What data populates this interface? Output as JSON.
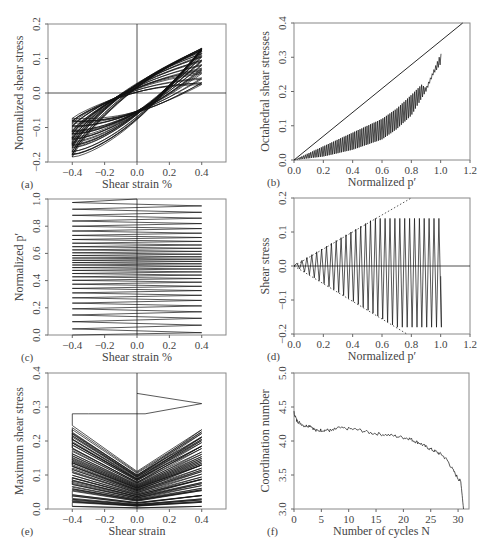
{
  "chart_data": [
    {
      "id": "a",
      "panel_label": "(a)",
      "type": "line",
      "title": "",
      "xlabel": "Shear strain %",
      "ylabel": "Normalized shear stress",
      "xlim": [
        -0.55,
        0.55
      ],
      "ylim": [
        -0.2,
        0.2
      ],
      "xticks": [
        -0.4,
        -0.2,
        0.0,
        0.2,
        0.4
      ],
      "xtick_labels": [
        "−0.4",
        "−0.2",
        "0.0",
        "0.2",
        "0.4"
      ],
      "yticks": [
        -0.2,
        -0.1,
        0.0,
        0.1,
        0.2
      ],
      "ytick_labels": [
        "−0.2",
        "−0.1",
        "0.0",
        "0.1",
        "0.2"
      ],
      "zero_lines": {
        "x": 0.0,
        "y": 0.0
      },
      "description": "Hysteresis loops of strain-controlled cyclic shear between -0.4% and 0.4% strain; stress amplitude ranges roughly -0.18 to 0.14",
      "series": [
        {
          "name": "stress-strain loops",
          "strain_range": [
            -0.4,
            0.4
          ],
          "stress_min": -0.18,
          "stress_max": 0.14,
          "cycles": 31
        }
      ]
    },
    {
      "id": "b",
      "panel_label": "(b)",
      "type": "line",
      "title": "",
      "xlabel": "Normalized p′",
      "ylabel": "Octahedral shear stresses",
      "xlim": [
        0.0,
        1.2
      ],
      "ylim": [
        0.0,
        0.4
      ],
      "xticks": [
        0.0,
        0.2,
        0.4,
        0.6,
        0.8,
        1.0,
        1.2
      ],
      "xtick_labels": [
        "0.0",
        "0.2",
        "0.4",
        "0.6",
        "0.8",
        "1.0",
        "1.2"
      ],
      "yticks": [
        0.0,
        0.1,
        0.2,
        0.3,
        0.4
      ],
      "ytick_labels": [
        "0.0",
        "0.1",
        "0.2",
        "0.3",
        "0.4"
      ],
      "series": [
        {
          "name": "failure line",
          "x": [
            0.0,
            1.15
          ],
          "y": [
            0.0,
            0.4
          ]
        },
        {
          "name": "stress path",
          "x": [
            0.0,
            0.1,
            0.2,
            0.3,
            0.4,
            0.5,
            0.6,
            0.7,
            0.8,
            0.87,
            0.9,
            0.95,
            1.0
          ],
          "y_upper": [
            0.0,
            0.02,
            0.04,
            0.06,
            0.08,
            0.1,
            0.12,
            0.15,
            0.19,
            0.22,
            0.21,
            0.26,
            0.31
          ],
          "y_lower": [
            0.0,
            0.005,
            0.01,
            0.02,
            0.03,
            0.045,
            0.06,
            0.09,
            0.13,
            0.18,
            0.2,
            0.25,
            0.28
          ]
        }
      ]
    },
    {
      "id": "c",
      "panel_label": "(c)",
      "type": "line",
      "title": "",
      "xlabel": "Shear strain %",
      "ylabel": "Normalized p′",
      "xlim": [
        -0.55,
        0.55
      ],
      "ylim": [
        0.0,
        1.0
      ],
      "xticks": [
        -0.4,
        -0.2,
        0.0,
        0.2,
        0.4
      ],
      "xtick_labels": [
        "−0.4",
        "−0.2",
        "0.0",
        "0.2",
        "0.4"
      ],
      "yticks": [
        0.0,
        0.2,
        0.4,
        0.6,
        0.8,
        1.0
      ],
      "ytick_labels": [
        "0.0",
        "0.2",
        "0.4",
        "0.6",
        "0.8",
        "1.0"
      ],
      "zero_lines": {
        "x": 0.0
      },
      "description": "Zig-zag evolution of normalized mean effective stress vs strain; p' decreases from 1.0 toward 0.0 over cycles",
      "series": [
        {
          "name": "p' path",
          "strain_range": [
            -0.4,
            0.4
          ],
          "p_start": 1.0,
          "p_end": 0.0
        }
      ]
    },
    {
      "id": "d",
      "panel_label": "(d)",
      "type": "line",
      "title": "",
      "xlabel": "Normalized p′",
      "ylabel": "Shear stress",
      "xlim": [
        0.0,
        1.2
      ],
      "ylim": [
        -0.2,
        0.2
      ],
      "xticks": [
        0.0,
        0.2,
        0.4,
        0.6,
        0.8,
        1.0,
        1.2
      ],
      "xtick_labels": [
        "0.0",
        "0.2",
        "0.4",
        "0.6",
        "0.8",
        "1.0",
        "1.2"
      ],
      "yticks": [
        -0.2,
        -0.1,
        0.0,
        0.1,
        0.2
      ],
      "ytick_labels": [
        "−0.2",
        "−0.1",
        "0.0",
        "0.1",
        "0.2"
      ],
      "zero_lines": {
        "y": 0.0
      },
      "series": [
        {
          "name": "compression failure line (dotted)",
          "x": [
            0.0,
            0.8
          ],
          "y": [
            0.0,
            0.2
          ]
        },
        {
          "name": "extension failure line (dotted)",
          "x": [
            0.0,
            0.77
          ],
          "y": [
            0.0,
            -0.2
          ]
        },
        {
          "name": "stress path",
          "x_range": [
            0.0,
            1.0
          ],
          "peak_upper": 0.14,
          "peak_lower": -0.18
        }
      ]
    },
    {
      "id": "e",
      "panel_label": "(e)",
      "type": "line",
      "title": "",
      "xlabel": "Shear strain",
      "ylabel": "Maximum shear stress",
      "xlim": [
        -0.55,
        0.55
      ],
      "ylim": [
        0.0,
        0.4
      ],
      "xticks": [
        -0.4,
        -0.2,
        0.0,
        0.2,
        0.4
      ],
      "xtick_labels": [
        "−0.4",
        "−0.2",
        "0.0",
        "0.2",
        "0.4"
      ],
      "yticks": [
        0.0,
        0.1,
        0.2,
        0.3,
        0.4
      ],
      "ytick_labels": [
        "0.0",
        "0.1",
        "0.2",
        "0.3",
        "0.4"
      ],
      "zero_lines": {
        "x": 0.0
      },
      "description": "Maximum shear stress vs strain; starts at 0.34 at zero strain and decays to near 0 with cycling",
      "series": [
        {
          "name": "max shear stress path",
          "start_value": 0.34,
          "strain_range": [
            -0.4,
            0.4
          ]
        }
      ]
    },
    {
      "id": "f",
      "panel_label": "(f)",
      "type": "line",
      "title": "",
      "xlabel": "Number of cycles N",
      "ylabel": "Coordination number",
      "xlim": [
        0,
        32
      ],
      "ylim": [
        3.0,
        5.0
      ],
      "xticks": [
        0,
        5,
        10,
        15,
        20,
        25,
        30
      ],
      "xtick_labels": [
        "0",
        "5",
        "10",
        "15",
        "20",
        "25",
        "30"
      ],
      "yticks": [
        3.0,
        3.5,
        4.0,
        4.5,
        5.0
      ],
      "ytick_labels": [
        "3.0",
        "3.5",
        "4.0",
        "4.5",
        "5.0"
      ],
      "series": [
        {
          "name": "coordination number",
          "x": [
            0,
            0.5,
            1,
            2,
            3,
            4,
            5,
            6,
            7,
            8,
            10,
            12,
            14,
            16,
            18,
            20,
            21,
            22,
            23,
            24,
            25,
            26,
            27,
            28,
            29,
            30,
            30.5,
            31
          ],
          "y": [
            4.42,
            4.3,
            4.27,
            4.22,
            4.23,
            4.15,
            4.16,
            4.16,
            4.15,
            4.19,
            4.18,
            4.16,
            4.12,
            4.1,
            4.08,
            4.05,
            4.04,
            4.0,
            3.97,
            3.92,
            3.88,
            3.84,
            3.8,
            3.72,
            3.58,
            3.45,
            3.4,
            3.0
          ]
        }
      ]
    }
  ]
}
